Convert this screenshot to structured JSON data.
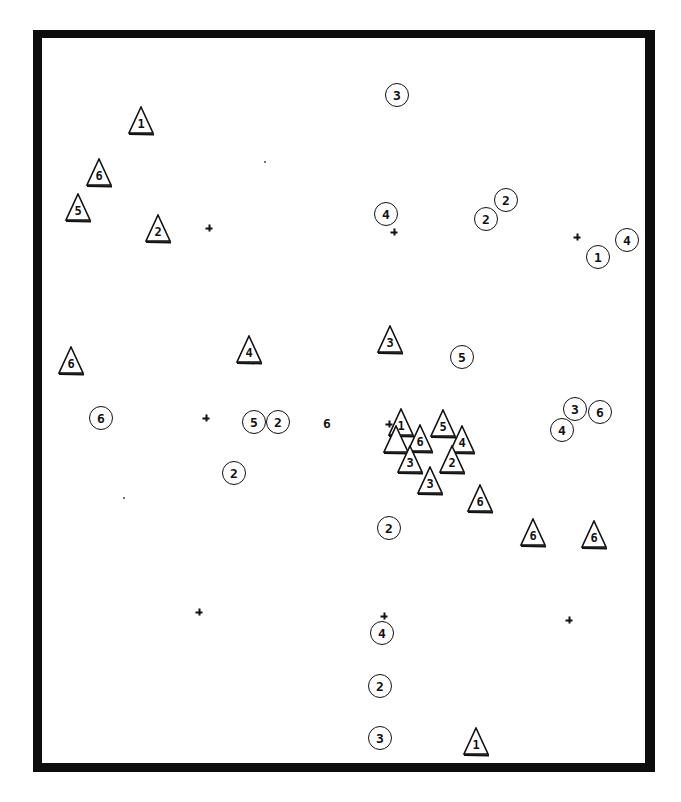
{
  "chart_data": {
    "type": "scatter",
    "title": "",
    "xlabel": "",
    "ylabel": "",
    "grid": false,
    "legend": null,
    "frame": "thick black border, no axes or tick labels",
    "coordinate_system": "pixel positions within 681x802 image",
    "series": [
      {
        "name": "triangles",
        "marker": "triangle",
        "points": [
          {
            "x": 141,
            "y": 121,
            "label": "1"
          },
          {
            "x": 99,
            "y": 173,
            "label": "6"
          },
          {
            "x": 78,
            "y": 208,
            "label": "5"
          },
          {
            "x": 158,
            "y": 229,
            "label": "2"
          },
          {
            "x": 71,
            "y": 361,
            "label": "6"
          },
          {
            "x": 249,
            "y": 350,
            "label": "4"
          },
          {
            "x": 390,
            "y": 340,
            "label": "3"
          },
          {
            "x": 401,
            "y": 423,
            "label": "1"
          },
          {
            "x": 443,
            "y": 424,
            "label": "5"
          },
          {
            "x": 396,
            "y": 440,
            "label": ""
          },
          {
            "x": 420,
            "y": 439,
            "label": "6"
          },
          {
            "x": 462,
            "y": 440,
            "label": "4"
          },
          {
            "x": 410,
            "y": 460,
            "label": "3"
          },
          {
            "x": 452,
            "y": 460,
            "label": "2"
          },
          {
            "x": 430,
            "y": 481,
            "label": "3"
          },
          {
            "x": 480,
            "y": 499,
            "label": "6"
          },
          {
            "x": 533,
            "y": 533,
            "label": "6"
          },
          {
            "x": 594,
            "y": 535,
            "label": "6"
          },
          {
            "x": 476,
            "y": 742,
            "label": "1"
          }
        ]
      },
      {
        "name": "circles",
        "marker": "circle",
        "points": [
          {
            "x": 397,
            "y": 95,
            "label": "3"
          },
          {
            "x": 386,
            "y": 214,
            "label": "4"
          },
          {
            "x": 486,
            "y": 219,
            "label": "2"
          },
          {
            "x": 506,
            "y": 200,
            "label": "2"
          },
          {
            "x": 598,
            "y": 257,
            "label": "1"
          },
          {
            "x": 627,
            "y": 240,
            "label": "4"
          },
          {
            "x": 462,
            "y": 357,
            "label": "5"
          },
          {
            "x": 101,
            "y": 418,
            "label": "6"
          },
          {
            "x": 254,
            "y": 422,
            "label": "5"
          },
          {
            "x": 278,
            "y": 422,
            "label": "2"
          },
          {
            "x": 234,
            "y": 473,
            "label": "2"
          },
          {
            "x": 575,
            "y": 409,
            "label": "3"
          },
          {
            "x": 600,
            "y": 412,
            "label": "6"
          },
          {
            "x": 562,
            "y": 430,
            "label": "4"
          },
          {
            "x": 389,
            "y": 528,
            "label": "2"
          },
          {
            "x": 382,
            "y": 633,
            "label": "4"
          },
          {
            "x": 380,
            "y": 686,
            "label": "2"
          },
          {
            "x": 380,
            "y": 738,
            "label": "3"
          }
        ]
      },
      {
        "name": "unmarked",
        "marker": "text",
        "points": [
          {
            "x": 327,
            "y": 423,
            "label": "6"
          }
        ]
      },
      {
        "name": "reference-crosses",
        "marker": "plus",
        "points": [
          {
            "x": 209,
            "y": 228
          },
          {
            "x": 394,
            "y": 232
          },
          {
            "x": 577,
            "y": 237
          },
          {
            "x": 206,
            "y": 418
          },
          {
            "x": 389,
            "y": 424
          },
          {
            "x": 199,
            "y": 612
          },
          {
            "x": 384,
            "y": 616
          },
          {
            "x": 569,
            "y": 620
          }
        ]
      },
      {
        "name": "specks",
        "marker": "dot",
        "points": [
          {
            "x": 265,
            "y": 162
          },
          {
            "x": 124,
            "y": 498
          }
        ]
      }
    ]
  },
  "colors": {
    "ink": "#111111",
    "background": "#ffffff",
    "frame": "#0d0d0d"
  }
}
